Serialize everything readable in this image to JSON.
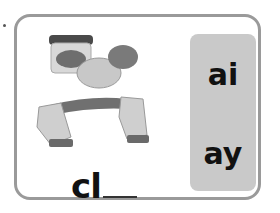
{
  "card": {
    "image_alt": "hands stretching clay with a jar of clay",
    "word_prefix": "cl",
    "choices": [
      "ai",
      "ay"
    ]
  }
}
